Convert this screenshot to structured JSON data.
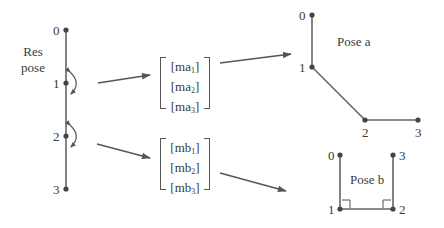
{
  "diagram": {
    "rest_pose": {
      "label_line1": "Res",
      "label_line2": "pose",
      "joints": [
        "0",
        "1",
        "2",
        "3"
      ]
    },
    "matrix_a": {
      "rows": [
        {
          "base": "[ma",
          "sub": "1",
          "close": "]"
        },
        {
          "base": "[ma",
          "sub": "2",
          "close": "]"
        },
        {
          "base": "[ma",
          "sub": "3",
          "close": "]"
        }
      ]
    },
    "matrix_b": {
      "rows": [
        {
          "base": "[mb",
          "sub": "1",
          "close": "]"
        },
        {
          "base": "[mb",
          "sub": "2",
          "close": "]"
        },
        {
          "base": "[mb",
          "sub": "3",
          "close": "]"
        }
      ]
    },
    "pose_a": {
      "label": "Pose a",
      "joints": [
        "0",
        "1",
        "2",
        "3"
      ]
    },
    "pose_b": {
      "label": "Pose b",
      "joints": [
        "0",
        "1",
        "2",
        "3"
      ]
    },
    "colors": {
      "line": "#555555",
      "joint": "#444444",
      "text": "#3a3a3a"
    }
  }
}
